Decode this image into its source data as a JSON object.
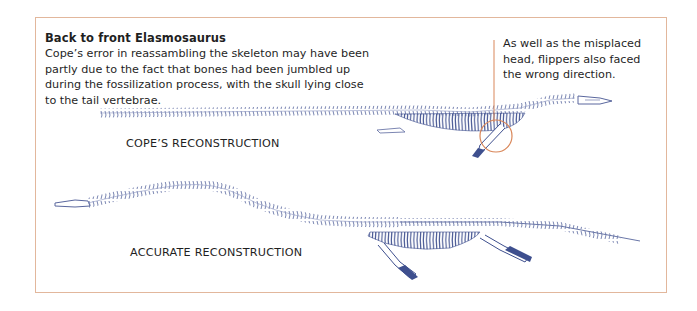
{
  "figure": {
    "title": "Back to front Elasmosaurus",
    "body": "Cope’s error in reassambling the skeleton may have been partly due to the fact that bones had been jumbled up during the fossilization process, with the skull lying close to the tail vertebrae.",
    "annotation": "As well as the misplaced head, flippers also faced the wrong direction.",
    "labels": {
      "cope": "COPE’S RECONSTRUCTION",
      "accurate": "ACCURATE RECONSTRUCTION"
    },
    "colors": {
      "frame": "#e2b79c",
      "skeleton": "#4a5a96",
      "skeleton_light": "#9aa4c8",
      "highlight": "#d9875a",
      "text": "#1f1f1f"
    }
  }
}
